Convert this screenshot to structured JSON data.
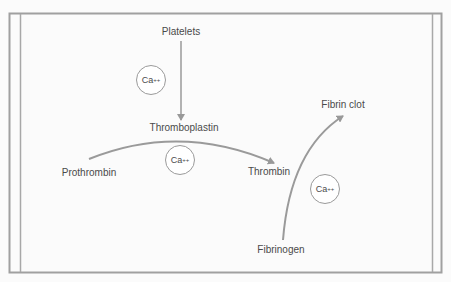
{
  "diagram": {
    "labels": {
      "platelets": "Platelets",
      "thromboplastin": "Thromboplastin",
      "prothrombin": "Prothrombin",
      "thrombin": "Thrombin",
      "fibrinogen": "Fibrinogen",
      "fibrin_clot": "Fibrin clot"
    },
    "calcium": [
      {
        "base": "Ca",
        "charge": "++"
      },
      {
        "base": "Ca",
        "charge": "++"
      },
      {
        "base": "Ca",
        "charge": "++"
      }
    ],
    "colors": {
      "line": "#9a9a9a",
      "border": "#999999",
      "text": "#4a4a4a"
    }
  }
}
